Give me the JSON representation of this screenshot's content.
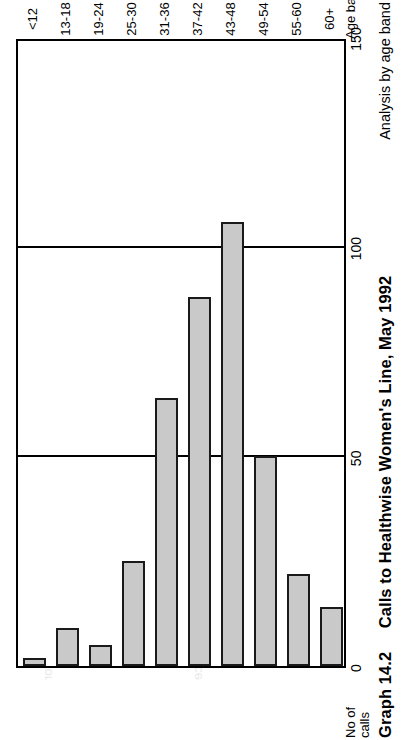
{
  "figure": {
    "caption_label": "Graph 14.2",
    "caption_title": "Calls to Healthwise Women's Line, May 1992",
    "caption_sub": "Analysis by age band"
  },
  "chart_data": {
    "type": "bar",
    "orientation": "horizontal",
    "title": "Calls to Healthwise Women's Line, May 1992",
    "subtitle": "Analysis by age band",
    "xlabel": "Age band",
    "ylabel": "No of calls",
    "ylim": [
      0,
      150
    ],
    "yticks": [
      0,
      50,
      100,
      150
    ],
    "grid": true,
    "legend": "none",
    "categories": [
      "<12",
      "13-18",
      "19-24",
      "25-30",
      "31-36",
      "37-42",
      "43-48",
      "49-54",
      "55-60",
      "60+"
    ],
    "values": [
      2,
      9,
      5,
      25,
      64,
      88,
      106,
      50,
      22,
      14
    ],
    "bar_color": "#c9c9c9",
    "bar_edge_color": "#1a1a1a"
  },
  "axes": {
    "value_axis_title_line1": "No of",
    "value_axis_title_line2": "calls",
    "value_ticks": [
      "0",
      "50",
      "100",
      "150"
    ],
    "category_axis_title": "Age band",
    "category_ticks": [
      "<12",
      "13-18",
      "19-24",
      "25-30",
      "31-36",
      "37-42",
      "43-48",
      "49-54",
      "55-60",
      "60+"
    ]
  },
  "ghost_text": [
    "a specialist service for",
    "supporting women through",
    "the difficult process of",
    "information and advice",
    "referral to other agencies",
    "confidential helpline"
  ]
}
